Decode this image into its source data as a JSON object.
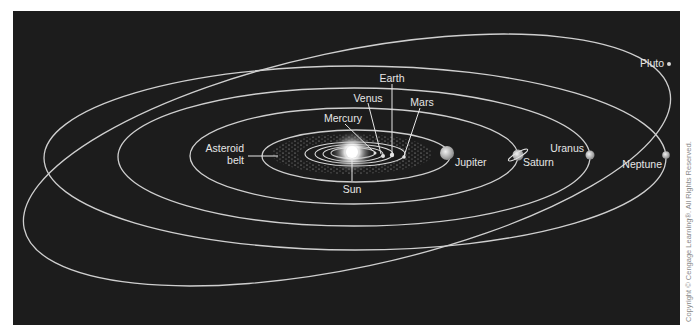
{
  "diagram": {
    "colors": {
      "background": "#1c1c1c",
      "orbit": "#cfcfcf",
      "label": "#e6e6e6",
      "page": "#ffffff"
    },
    "labels": {
      "sun": "Sun",
      "mercury": "Mercury",
      "venus": "Venus",
      "earth": "Earth",
      "mars": "Mars",
      "asteroid_belt_line1": "Asteroid",
      "asteroid_belt_line2": "belt",
      "jupiter": "Jupiter",
      "saturn": "Saturn",
      "uranus": "Uranus",
      "neptune": "Neptune",
      "pluto": "Pluto"
    },
    "bodies": [
      {
        "name": "Sun",
        "x": 352,
        "y": 152
      },
      {
        "name": "Mercury",
        "x": 375,
        "y": 153
      },
      {
        "name": "Venus",
        "x": 382,
        "y": 155
      },
      {
        "name": "Earth",
        "x": 392,
        "y": 154
      },
      {
        "name": "Mars",
        "x": 403,
        "y": 156
      },
      {
        "name": "Jupiter",
        "x": 447,
        "y": 153
      },
      {
        "name": "Saturn",
        "x": 518,
        "y": 155
      },
      {
        "name": "Uranus",
        "x": 590,
        "y": 155
      },
      {
        "name": "Neptune",
        "x": 666,
        "y": 155
      },
      {
        "name": "Pluto",
        "x": 669,
        "y": 64
      }
    ],
    "copyright": "Copyright © Cengage Learning®. All Rights Reserved."
  }
}
